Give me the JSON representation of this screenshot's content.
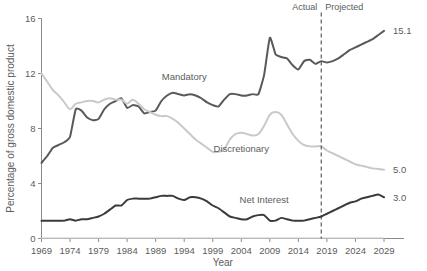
{
  "chart_data": {
    "type": "line",
    "title": "",
    "xlabel": "Year",
    "ylabel": "Percentage of gross domestic product",
    "xlim": [
      1969,
      2029
    ],
    "ylim": [
      0,
      16
    ],
    "grid": false,
    "legend_position": "inline-labels",
    "xticks": [
      1969,
      1974,
      1979,
      1984,
      1989,
      1994,
      1999,
      2004,
      2009,
      2014,
      2019,
      2024,
      2029
    ],
    "yticks": [
      0,
      4,
      8,
      12,
      16
    ],
    "annotations": {
      "actual_label": "Actual",
      "projected_label": "Projected",
      "divider_year": 2018,
      "divider_separator": "|"
    },
    "series": [
      {
        "name": "Mandatory",
        "color": "#595959",
        "label_x": 1994,
        "label_y": 11.55,
        "end_value_label": "15.1",
        "x": [
          1969,
          1970,
          1971,
          1972,
          1973,
          1974,
          1975,
          1976,
          1977,
          1978,
          1979,
          1980,
          1981,
          1982,
          1983,
          1984,
          1985,
          1986,
          1987,
          1988,
          1989,
          1990,
          1991,
          1992,
          1993,
          1994,
          1995,
          1996,
          1997,
          1998,
          1999,
          2000,
          2001,
          2002,
          2003,
          2004,
          2005,
          2006,
          2007,
          2008,
          2009,
          2010,
          2011,
          2012,
          2013,
          2014,
          2015,
          2016,
          2017,
          2018,
          2019,
          2020,
          2021,
          2022,
          2023,
          2024,
          2025,
          2026,
          2027,
          2028,
          2029
        ],
        "values": [
          5.5,
          6.0,
          6.6,
          6.8,
          7.0,
          7.4,
          9.4,
          9.3,
          8.8,
          8.6,
          8.7,
          9.4,
          9.8,
          10.0,
          10.2,
          9.5,
          9.7,
          9.6,
          9.1,
          9.2,
          9.3,
          10.0,
          10.4,
          10.6,
          10.5,
          10.4,
          10.5,
          10.4,
          10.2,
          9.9,
          9.7,
          9.6,
          10.1,
          10.5,
          10.5,
          10.4,
          10.4,
          10.5,
          10.5,
          11.9,
          14.6,
          13.4,
          13.2,
          13.1,
          12.6,
          12.3,
          12.9,
          13.0,
          12.7,
          12.9,
          12.8,
          12.9,
          13.1,
          13.4,
          13.7,
          13.9,
          14.1,
          14.3,
          14.5,
          14.8,
          15.1
        ]
      },
      {
        "name": "Discretionary",
        "color": "#c9c9c9",
        "label_x": 2004,
        "label_y": 6.3,
        "end_value_label": "5.0",
        "x": [
          1969,
          1970,
          1971,
          1972,
          1973,
          1974,
          1975,
          1976,
          1977,
          1978,
          1979,
          1980,
          1981,
          1982,
          1983,
          1984,
          1985,
          1986,
          1987,
          1988,
          1989,
          1990,
          1991,
          1992,
          1993,
          1994,
          1995,
          1996,
          1997,
          1998,
          1999,
          2000,
          2001,
          2002,
          2003,
          2004,
          2005,
          2006,
          2007,
          2008,
          2009,
          2010,
          2011,
          2012,
          2013,
          2014,
          2015,
          2016,
          2017,
          2018,
          2019,
          2020,
          2021,
          2022,
          2023,
          2024,
          2025,
          2026,
          2027,
          2028,
          2029
        ],
        "values": [
          12.0,
          11.4,
          10.8,
          10.4,
          9.9,
          9.4,
          9.8,
          9.9,
          10.0,
          10.0,
          9.9,
          10.1,
          10.2,
          10.1,
          10.1,
          9.8,
          10.1,
          9.8,
          9.4,
          9.2,
          9.0,
          8.9,
          8.9,
          8.7,
          8.4,
          8.0,
          7.6,
          7.2,
          6.9,
          6.6,
          6.3,
          6.3,
          6.5,
          7.2,
          7.6,
          7.7,
          7.6,
          7.5,
          7.6,
          8.2,
          9.0,
          9.2,
          9.0,
          8.3,
          7.6,
          7.1,
          6.8,
          6.7,
          6.7,
          6.7,
          6.4,
          6.2,
          6.0,
          5.8,
          5.6,
          5.4,
          5.3,
          5.2,
          5.1,
          5.05,
          5.0
        ]
      },
      {
        "name": "Net Interest",
        "color": "#3a3a3a",
        "label_x": 2008,
        "label_y": 2.55,
        "end_value_label": "3.0",
        "x": [
          1969,
          1970,
          1971,
          1972,
          1973,
          1974,
          1975,
          1976,
          1977,
          1978,
          1979,
          1980,
          1981,
          1982,
          1983,
          1984,
          1985,
          1986,
          1987,
          1988,
          1989,
          1990,
          1991,
          1992,
          1993,
          1994,
          1995,
          1996,
          1997,
          1998,
          1999,
          2000,
          2001,
          2002,
          2003,
          2004,
          2005,
          2006,
          2007,
          2008,
          2009,
          2010,
          2011,
          2012,
          2013,
          2014,
          2015,
          2016,
          2017,
          2018,
          2019,
          2020,
          2021,
          2022,
          2023,
          2024,
          2025,
          2026,
          2027,
          2028,
          2029
        ],
        "values": [
          1.3,
          1.3,
          1.3,
          1.3,
          1.3,
          1.4,
          1.3,
          1.4,
          1.4,
          1.5,
          1.6,
          1.8,
          2.1,
          2.4,
          2.4,
          2.8,
          2.9,
          2.9,
          2.9,
          2.9,
          3.0,
          3.1,
          3.1,
          3.1,
          2.9,
          2.8,
          3.0,
          3.0,
          2.9,
          2.7,
          2.4,
          2.2,
          1.9,
          1.6,
          1.5,
          1.4,
          1.4,
          1.6,
          1.7,
          1.7,
          1.3,
          1.3,
          1.5,
          1.4,
          1.3,
          1.3,
          1.3,
          1.4,
          1.5,
          1.6,
          1.8,
          2.0,
          2.2,
          2.4,
          2.6,
          2.7,
          2.9,
          3.0,
          3.1,
          3.2,
          3.0
        ]
      },
      {
        "name": "baseline",
        "color": "#c9c9c9",
        "hidden_label": true,
        "x": [
          1969,
          2029
        ],
        "values": [
          0.02,
          0.02
        ]
      }
    ]
  }
}
